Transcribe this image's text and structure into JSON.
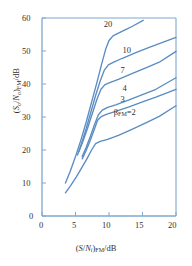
{
  "chart_data": {
    "type": "line",
    "title": "",
    "xlabel": "(S/Ni)FM/dB",
    "ylabel": "(So/No)FM/dB",
    "xlim": [
      0,
      20
    ],
    "ylim": [
      0,
      60
    ],
    "xticks": [
      0,
      5,
      10,
      15,
      20
    ],
    "yticks": [
      0,
      10,
      20,
      30,
      40,
      50,
      60
    ],
    "grid": false,
    "legend": "inline-curve-labels",
    "line_color": "#5a8cc2",
    "axis_color": "#7fa8cf",
    "text_color": "#33312f",
    "series": [
      {
        "name": "20",
        "label": "20",
        "label_x": 10.1,
        "label_y": 57.8,
        "points": [
          [
            3.5,
            10.0
          ],
          [
            4.2,
            13.5
          ],
          [
            5.0,
            18.0
          ],
          [
            5.8,
            23.0
          ],
          [
            6.6,
            28.5
          ],
          [
            7.4,
            34.5
          ],
          [
            8.2,
            40.5
          ],
          [
            8.9,
            46.0
          ],
          [
            9.5,
            50.5
          ],
          [
            10.0,
            53.2
          ],
          [
            10.6,
            54.6
          ],
          [
            11.4,
            55.4
          ],
          [
            12.4,
            56.4
          ],
          [
            13.5,
            57.5
          ],
          [
            15.1,
            59.3
          ]
        ]
      },
      {
        "name": "10",
        "label": "10",
        "label_x": 12.9,
        "label_y": 50.0,
        "points": [
          [
            5.3,
            18.5
          ],
          [
            5.9,
            22.0
          ],
          [
            6.6,
            26.5
          ],
          [
            7.3,
            31.5
          ],
          [
            8.0,
            36.5
          ],
          [
            8.7,
            41.0
          ],
          [
            9.3,
            44.2
          ],
          [
            9.9,
            45.8
          ],
          [
            10.7,
            46.6
          ],
          [
            12.0,
            47.8
          ],
          [
            14.0,
            49.5
          ],
          [
            16.0,
            51.1
          ],
          [
            18.0,
            52.6
          ],
          [
            20.0,
            54.1
          ]
        ]
      },
      {
        "name": "7",
        "label": "7",
        "label_x": 12.6,
        "label_y": 44.0,
        "points": [
          [
            5.5,
            19.5
          ],
          [
            6.1,
            22.6
          ],
          [
            6.8,
            26.6
          ],
          [
            7.5,
            31.0
          ],
          [
            8.2,
            35.4
          ],
          [
            8.8,
            38.4
          ],
          [
            9.4,
            39.8
          ],
          [
            10.2,
            40.5
          ],
          [
            11.5,
            41.5
          ],
          [
            13.5,
            43.2
          ],
          [
            15.5,
            44.9
          ],
          [
            17.5,
            46.6
          ],
          [
            20.0,
            49.9
          ]
        ]
      },
      {
        "name": "4",
        "label": "4",
        "label_x": 12.9,
        "label_y": 38.6,
        "points": [
          [
            6.0,
            18.0
          ],
          [
            6.6,
            20.8
          ],
          [
            7.2,
            24.0
          ],
          [
            7.8,
            27.5
          ],
          [
            8.4,
            30.6
          ],
          [
            9.0,
            32.1
          ],
          [
            9.8,
            32.9
          ],
          [
            11.0,
            33.7
          ],
          [
            13.0,
            35.2
          ],
          [
            15.0,
            36.8
          ],
          [
            17.0,
            38.4
          ],
          [
            20.0,
            41.9
          ]
        ]
      },
      {
        "name": "3",
        "label": "3",
        "label_x": 12.6,
        "label_y": 35.3,
        "points": [
          [
            6.0,
            17.3
          ],
          [
            6.6,
            19.9
          ],
          [
            7.2,
            22.9
          ],
          [
            7.8,
            26.2
          ],
          [
            8.3,
            29.0
          ],
          [
            8.9,
            30.2
          ],
          [
            9.7,
            30.9
          ],
          [
            11.0,
            31.7
          ],
          [
            13.0,
            33.1
          ],
          [
            15.0,
            34.6
          ],
          [
            17.0,
            36.0
          ],
          [
            20.0,
            38.4
          ]
        ]
      },
      {
        "name": "2",
        "label": "βFM=2",
        "label_x": 11.6,
        "label_y": 31.2,
        "points": [
          [
            3.5,
            7.0
          ],
          [
            4.3,
            9.3
          ],
          [
            5.1,
            11.8
          ],
          [
            5.9,
            14.5
          ],
          [
            6.7,
            17.3
          ],
          [
            7.4,
            20.0
          ],
          [
            8.0,
            21.9
          ],
          [
            8.7,
            22.6
          ],
          [
            9.8,
            23.2
          ],
          [
            11.5,
            24.5
          ],
          [
            13.5,
            26.3
          ],
          [
            15.5,
            28.2
          ],
          [
            17.5,
            30.2
          ],
          [
            20.0,
            33.4
          ]
        ]
      }
    ]
  },
  "axes": {
    "x_tick_labels": [
      "0",
      "5",
      "10",
      "15",
      "20"
    ],
    "y_tick_labels": [
      "0",
      "10",
      "20",
      "30",
      "40",
      "50",
      "60"
    ]
  },
  "labels": {
    "xlabel_parts": {
      "open": "(",
      "s": "S",
      "slash": "/",
      "n": "N",
      "nsub": "i",
      "close": ")",
      "fm": "FM",
      "unit": "/dB"
    },
    "ylabel_parts": {
      "open": "(",
      "s": "S",
      "ssub": "o",
      "slash": "/",
      "n": "N",
      "nsub": "o",
      "close": ")",
      "fm": "FM",
      "unit": "/dB"
    },
    "beta_symbol": "β",
    "beta_sub": "FM",
    "beta_eq": "=2"
  }
}
